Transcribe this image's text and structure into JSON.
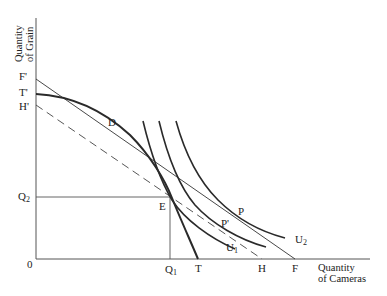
{
  "diagram": {
    "type": "production-possibility / indifference curve trade diagram",
    "y_axis_title": [
      "Quantity",
      "of Grain"
    ],
    "x_axis_title": [
      "Quantity",
      "of Cameras"
    ],
    "origin_label": "0",
    "y_axis_labels": {
      "F_prime": "F'",
      "T_prime": "T'",
      "H_prime": "H'",
      "Q2": "Q",
      "Q2_sub": "2"
    },
    "x_axis_labels": {
      "Q1": "Q",
      "Q1_sub": "1",
      "T": "T",
      "H": "H",
      "F": "F"
    },
    "points": {
      "D": "D",
      "E": "E",
      "P": "P",
      "P_prime": "P'"
    },
    "curves": {
      "U1": "U",
      "U1_sub": "1",
      "U2": "U",
      "U2_sub": "2"
    },
    "colors": {
      "line": "#2a2a2a",
      "axis": "#555555",
      "text": "#222222"
    },
    "elements": [
      {
        "name": "production-possibility-frontier",
        "from": "T'",
        "to": "T",
        "style": "solid-thick"
      },
      {
        "name": "price-line-FF'",
        "from": "F'",
        "to": "F",
        "tangent_at": "D",
        "style": "solid-thin"
      },
      {
        "name": "price-line-HH'",
        "from": "H'",
        "to": "H",
        "through": "E",
        "style": "dashed"
      },
      {
        "name": "indifference-curve-U1",
        "tangent_at": "P'",
        "style": "solid"
      },
      {
        "name": "indifference-curve-U2",
        "tangent_at": "P",
        "style": "solid"
      },
      {
        "name": "indifference-curve-through-E",
        "style": "solid"
      },
      {
        "name": "guide-lines-Q1-Q2",
        "through": "E",
        "style": "solid-thin"
      }
    ]
  }
}
